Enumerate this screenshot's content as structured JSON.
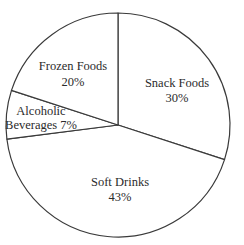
{
  "chart_data": {
    "type": "pie",
    "title": "",
    "categories": [
      "Snack Foods",
      "Soft Drinks",
      "Alcoholic Beverages",
      "Frozen Foods"
    ],
    "values": [
      30,
      43,
      7,
      20
    ],
    "unit": "%",
    "start_angle_deg": -90,
    "direction": "clockwise",
    "legend": "none (direct labels)",
    "labels": [
      {
        "name": "Snack Foods",
        "lines": [
          "Snack Foods",
          "30%"
        ]
      },
      {
        "name": "Soft Drinks",
        "lines": [
          "Soft Drinks",
          "43%"
        ]
      },
      {
        "name": "Alcoholic Beverages",
        "lines": [
          "Alcoholic",
          "Beverages 7%"
        ]
      },
      {
        "name": "Frozen Foods",
        "lines": [
          "Frozen Foods",
          "20%"
        ]
      }
    ]
  },
  "style": {
    "background": "#ffffff",
    "slice_fill": "#ffffff",
    "stroke": "#3a3a3a",
    "text": "#2b2b2b"
  }
}
